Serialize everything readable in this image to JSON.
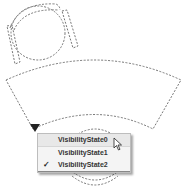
{
  "drawing": {
    "description": "Dashed CAD block outlines (round table with chairs, curved desk)",
    "stroke_color": "#777777"
  },
  "dynamic_block": {
    "grip": "visibility-grip-triangle"
  },
  "visibility_menu": {
    "items": [
      {
        "label": "VisibilityState0",
        "checked": false,
        "hovered": true
      },
      {
        "label": "VisibilityState1",
        "checked": false,
        "hovered": false
      },
      {
        "label": "VisibilityState2",
        "checked": true,
        "hovered": false
      }
    ],
    "check_glyph": "✓"
  }
}
